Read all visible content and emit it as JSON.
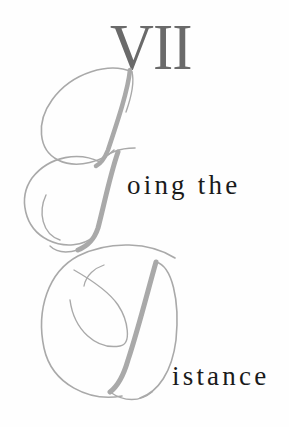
{
  "chapter": {
    "number": "VII",
    "title": "Going the Distance",
    "drop_cap_1": "G",
    "line_1_rest": "oing the",
    "drop_cap_2": "D",
    "line_2_rest": "istance"
  },
  "colors": {
    "chapter_number": "#6a6a6a",
    "script_letters": "#a9a9a9",
    "title_text": "#1a1a1a",
    "background": "#fefefe"
  }
}
